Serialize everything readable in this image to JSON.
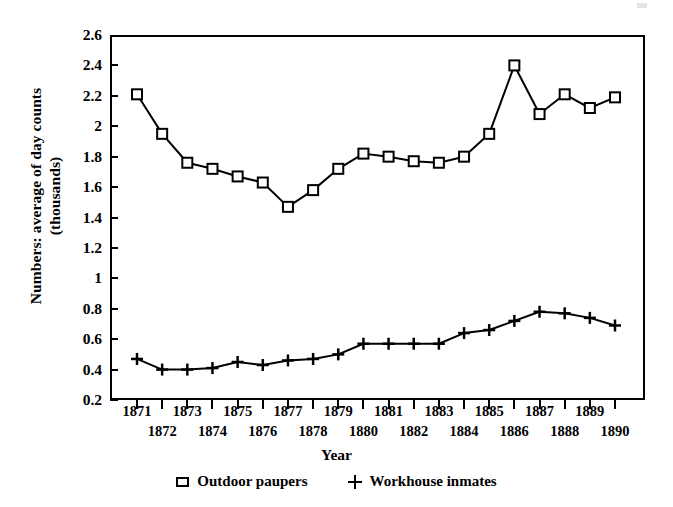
{
  "figure": {
    "background_color": "#ffffff",
    "ink_color": "#000000"
  },
  "chart_data": {
    "type": "line",
    "title": "",
    "xlabel": "Year",
    "ylabel": "Numbers: average of day counts\n(thousands)",
    "categories": [
      "1871",
      "1872",
      "1873",
      "1874",
      "1875",
      "1876",
      "1877",
      "1878",
      "1879",
      "1880",
      "1881",
      "1882",
      "1883",
      "1884",
      "1885",
      "1886",
      "1887",
      "1888",
      "1889",
      "1890"
    ],
    "x": [
      1871,
      1872,
      1873,
      1874,
      1875,
      1876,
      1877,
      1878,
      1879,
      1880,
      1881,
      1882,
      1883,
      1884,
      1885,
      1886,
      1887,
      1888,
      1889,
      1890
    ],
    "xlim": [
      1870.5,
      1890.5
    ],
    "ylim": [
      0.2,
      2.6
    ],
    "yticks": [
      0.2,
      0.4,
      0.6,
      0.8,
      1,
      1.2,
      1.4,
      1.6,
      1.8,
      2,
      2.2,
      2.4,
      2.6
    ],
    "ytick_labels": [
      "0.2",
      "0.4",
      "0.6",
      "0.8",
      "1",
      "1.2",
      "1.4",
      "1.6",
      "1.8",
      "2",
      "2.2",
      "2.4",
      "2.6"
    ],
    "grid": false,
    "legend_position": "below-center",
    "series": [
      {
        "name": "Outdoor paupers",
        "marker": "open-square",
        "values": [
          2.21,
          1.95,
          1.76,
          1.72,
          1.67,
          1.63,
          1.47,
          1.58,
          1.72,
          1.82,
          1.8,
          1.77,
          1.76,
          1.8,
          1.95,
          2.4,
          2.08,
          2.21,
          2.12,
          2.19
        ]
      },
      {
        "name": "Workhouse inmates",
        "marker": "plus",
        "values": [
          0.47,
          0.4,
          0.4,
          0.41,
          0.45,
          0.43,
          0.46,
          0.47,
          0.5,
          0.57,
          0.57,
          0.57,
          0.57,
          0.64,
          0.66,
          0.72,
          0.78,
          0.77,
          0.74,
          0.69
        ]
      }
    ]
  },
  "axes": {
    "x_title": "Year",
    "y_title": "Numbers: average of day counts\n(thousands)"
  },
  "legend": {
    "entries": [
      {
        "label": "Outdoor paupers",
        "marker": "open-square-marker"
      },
      {
        "label": "Workhouse inmates",
        "marker": "plus-marker"
      }
    ]
  }
}
